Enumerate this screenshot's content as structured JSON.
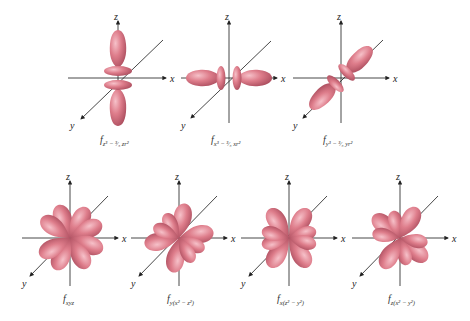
{
  "figure": {
    "lobe_color": "#d9707f",
    "lobe_highlight": "#f3b3bd",
    "lobe_shadow": "#a8495a",
    "axis_color": "#333333",
    "axis_labels": {
      "x": "x",
      "y": "y",
      "z": "z"
    },
    "orbitals": [
      {
        "id": "fz3",
        "label_main": "f",
        "label_sub": "z³ − ³⁄₅ zr²",
        "row": 1
      },
      {
        "id": "fx3",
        "label_main": "f",
        "label_sub": "x³ − ³⁄₅ xr²",
        "row": 1
      },
      {
        "id": "fy3",
        "label_main": "f",
        "label_sub": "y³ − ³⁄₅ yr²",
        "row": 1
      },
      {
        "id": "fxyz",
        "label_main": "f",
        "label_sub": "xyz",
        "row": 2
      },
      {
        "id": "fy(x2-z2)",
        "label_main": "f",
        "label_sub": "y(x² − z²)",
        "row": 2
      },
      {
        "id": "fx(z2-y2)",
        "label_main": "f",
        "label_sub": "x(z² − y²)",
        "row": 2
      },
      {
        "id": "fz(x2-y2)",
        "label_main": "f",
        "label_sub": "z(x² − y²)",
        "row": 2
      }
    ]
  }
}
